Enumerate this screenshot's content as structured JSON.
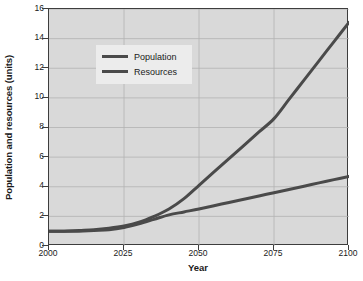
{
  "chart_data": {
    "type": "line",
    "title": "",
    "xlabel": "Year",
    "ylabel": "Population and resources (units)",
    "xlim": [
      2000,
      2100
    ],
    "ylim": [
      0,
      16
    ],
    "xticks": [
      2000,
      2025,
      2050,
      2075,
      2100
    ],
    "xtick_labels": [
      "2000",
      "2025",
      "2050",
      "2075",
      "2100"
    ],
    "yticks": [
      0,
      2,
      4,
      6,
      8,
      10,
      12,
      14,
      16
    ],
    "ytick_labels": [
      "0",
      "2",
      "4",
      "6",
      "8",
      "10",
      "12",
      "14",
      "16"
    ],
    "grid": true,
    "grid_axis": "both",
    "legend_position": "upper-left-inside",
    "plot_background": "#d9d9d9",
    "line_color": "#4a4a4a",
    "x": [
      2000,
      2005,
      2010,
      2015,
      2020,
      2025,
      2030,
      2035,
      2040,
      2045,
      2050,
      2055,
      2060,
      2065,
      2070,
      2075,
      2080,
      2085,
      2090,
      2095,
      2100
    ],
    "series": [
      {
        "name": "Population",
        "values": [
          1.0,
          1.0,
          1.05,
          1.1,
          1.2,
          1.35,
          1.6,
          2.0,
          2.5,
          3.2,
          4.1,
          5.0,
          5.9,
          6.8,
          7.7,
          8.6,
          9.9,
          11.2,
          12.5,
          13.8,
          15.1
        ]
      },
      {
        "name": "Resources",
        "values": [
          1.0,
          1.0,
          1.0,
          1.05,
          1.1,
          1.25,
          1.5,
          1.8,
          2.1,
          2.3,
          2.5,
          2.72,
          2.94,
          3.16,
          3.38,
          3.6,
          3.82,
          4.04,
          4.26,
          4.48,
          4.7
        ]
      }
    ],
    "legend": [
      {
        "label": "Population"
      },
      {
        "label": "Resources"
      }
    ]
  }
}
